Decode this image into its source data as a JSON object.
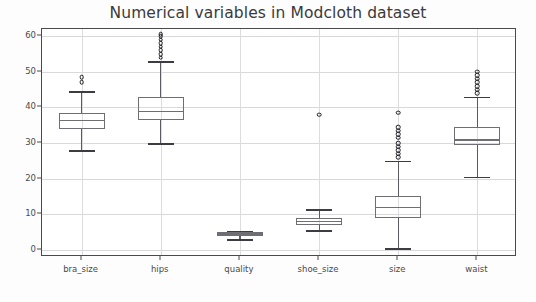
{
  "chart_data": {
    "type": "box",
    "title": "Numerical variables in Modcloth dataset",
    "xlabel": "",
    "ylabel": "",
    "ylim": [
      -2,
      62
    ],
    "yticks": [
      0,
      10,
      20,
      30,
      40,
      50,
      60
    ],
    "grid": true,
    "legend": null,
    "categories": [
      "bra_size",
      "hips",
      "quality",
      "shoe_size",
      "size",
      "waist"
    ],
    "boxes": [
      {
        "label": "bra_size",
        "whisker_low": 28.0,
        "q1": 34.0,
        "median": 36.5,
        "q3": 38.5,
        "whisker_high": 44.5,
        "fliers": [
          47.0,
          48.5
        ]
      },
      {
        "label": "hips",
        "whisker_low": 30.0,
        "q1": 36.5,
        "median": 39.0,
        "q3": 43.0,
        "whisker_high": 53.0,
        "fliers": [
          54.0,
          55.0,
          56.0,
          57.0,
          58.0,
          59.0,
          60.0,
          60.5
        ]
      },
      {
        "label": "quality",
        "whisker_low": 3.0,
        "q1": 4.0,
        "median": 4.6,
        "q3": 5.0,
        "whisker_high": 5.2,
        "fliers": []
      },
      {
        "label": "shoe_size",
        "whisker_low": 5.5,
        "q1": 7.0,
        "median": 8.0,
        "q3": 9.0,
        "whisker_high": 11.5,
        "fliers": [
          38.0
        ]
      },
      {
        "label": "size",
        "whisker_low": 0.5,
        "q1": 9.0,
        "median": 12.0,
        "q3": 15.0,
        "whisker_high": 25.0,
        "fliers": [
          26.0,
          27.0,
          28.0,
          29.0,
          30.0,
          31.5,
          32.5,
          33.5,
          34.5,
          38.5
        ]
      },
      {
        "label": "waist",
        "whisker_low": 20.5,
        "q1": 29.5,
        "median": 31.0,
        "q3": 34.5,
        "whisker_high": 43.0,
        "fliers": [
          44.0,
          45.0,
          46.0,
          47.0,
          48.0,
          49.0,
          50.0
        ]
      }
    ]
  }
}
